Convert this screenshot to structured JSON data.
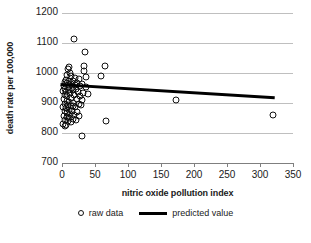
{
  "chart_data": {
    "type": "scatter",
    "title": "",
    "xlabel": "nitric oxide pollution index",
    "ylabel": "death rate per 100,000",
    "xlim": [
      0,
      350
    ],
    "ylim": [
      700,
      1200
    ],
    "xticks": [
      0,
      50,
      100,
      150,
      200,
      250,
      300,
      350
    ],
    "yticks": [
      700,
      800,
      900,
      1000,
      1100,
      1200
    ],
    "grid": "horizontal",
    "legend_position": "bottom-center",
    "series": [
      {
        "name": "raw data",
        "type": "scatter",
        "marker": "open-circle",
        "color": "#111111",
        "points": [
          [
            18,
            1112
          ],
          [
            35,
            1070
          ],
          [
            65,
            1022
          ],
          [
            10,
            1020
          ],
          [
            9,
            1014
          ],
          [
            33,
            1022
          ],
          [
            34,
            1008
          ],
          [
            59,
            989
          ],
          [
            37,
            986
          ],
          [
            12,
            1000
          ],
          [
            8,
            995
          ],
          [
            14,
            990
          ],
          [
            20,
            984
          ],
          [
            26,
            980
          ],
          [
            6,
            978
          ],
          [
            11,
            975
          ],
          [
            16,
            972
          ],
          [
            23,
            968
          ],
          [
            30,
            964
          ],
          [
            4,
            970
          ],
          [
            7,
            966
          ],
          [
            13,
            962
          ],
          [
            19,
            960
          ],
          [
            28,
            956
          ],
          [
            36,
            952
          ],
          [
            3,
            958
          ],
          [
            9,
            954
          ],
          [
            15,
            950
          ],
          [
            21,
            948
          ],
          [
            5,
            946
          ],
          [
            10,
            944
          ],
          [
            17,
            942
          ],
          [
            24,
            938
          ],
          [
            32,
            934
          ],
          [
            40,
            930
          ],
          [
            2,
            940
          ],
          [
            6,
            936
          ],
          [
            12,
            932
          ],
          [
            18,
            928
          ],
          [
            27,
            924
          ],
          [
            4,
            926
          ],
          [
            8,
            922
          ],
          [
            14,
            918
          ],
          [
            22,
            914
          ],
          [
            31,
            910
          ],
          [
            3,
            912
          ],
          [
            7,
            908
          ],
          [
            11,
            904
          ],
          [
            16,
            900
          ],
          [
            25,
            896
          ],
          [
            5,
            898
          ],
          [
            9,
            894
          ],
          [
            13,
            890
          ],
          [
            20,
            888
          ],
          [
            29,
            892
          ],
          [
            2,
            886
          ],
          [
            6,
            882
          ],
          [
            10,
            878
          ],
          [
            15,
            874
          ],
          [
            23,
            870
          ],
          [
            4,
            872
          ],
          [
            8,
            868
          ],
          [
            12,
            864
          ],
          [
            18,
            860
          ],
          [
            26,
            856
          ],
          [
            3,
            858
          ],
          [
            7,
            854
          ],
          [
            11,
            850
          ],
          [
            16,
            846
          ],
          [
            21,
            842
          ],
          [
            5,
            844
          ],
          [
            9,
            840
          ],
          [
            14,
            836
          ],
          [
            2,
            830
          ],
          [
            6,
            826
          ],
          [
            4,
            822
          ],
          [
            17,
            890
          ],
          [
            66,
            840
          ],
          [
            31,
            790
          ],
          [
            172,
            910
          ],
          [
            320,
            860
          ]
        ]
      },
      {
        "name": "predicted value",
        "type": "line",
        "color": "#000000",
        "points": [
          [
            0,
            961
          ],
          [
            320,
            918
          ]
        ]
      }
    ]
  },
  "axes": {
    "y_tick_labels": [
      "1200",
      "1100",
      "1000",
      "900",
      "800",
      "700"
    ],
    "x_tick_labels": [
      "0",
      "50",
      "100",
      "150",
      "200",
      "250",
      "300",
      "350"
    ],
    "y_axis_title": "death rate per 100,000",
    "x_axis_title": "nitric oxide pollution index"
  },
  "legend": {
    "items": [
      {
        "label": "raw data",
        "marker": "open-circle"
      },
      {
        "label": "predicted value",
        "marker": "line"
      }
    ]
  },
  "colors": {
    "gridline": "#bfbfbf",
    "axis": "#7f7f7f",
    "marker_stroke": "#111111",
    "trend_line": "#000000",
    "text": "#1a1a1a",
    "background": "#ffffff"
  }
}
